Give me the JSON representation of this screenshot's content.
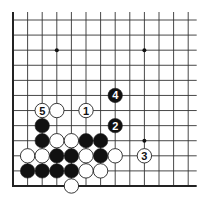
{
  "diagram": {
    "type": "go-board-diagram",
    "grid": {
      "columns": 13,
      "rows": 12,
      "origin_x": 13,
      "origin_y": 20,
      "spacing_x": 14.6,
      "spacing_y": 15.09,
      "edges": {
        "left": true,
        "bottom": true,
        "top": false,
        "right": false
      },
      "line_color": "#333333",
      "edge_color": "#222222"
    },
    "star_points": [
      {
        "col": 3,
        "row": 2
      },
      {
        "col": 9,
        "row": 2
      },
      {
        "col": 9,
        "row": 8
      }
    ],
    "stones": [
      {
        "col": 2,
        "row": 6,
        "color": "white",
        "label": "5"
      },
      {
        "col": 3,
        "row": 6,
        "color": "white",
        "label": ""
      },
      {
        "col": 5,
        "row": 6,
        "color": "white",
        "label": "1"
      },
      {
        "col": 7,
        "row": 5,
        "color": "black",
        "label": "4"
      },
      {
        "col": 2,
        "row": 7,
        "color": "black",
        "label": ""
      },
      {
        "col": 7,
        "row": 7,
        "color": "black",
        "label": "2"
      },
      {
        "col": 2,
        "row": 8,
        "color": "black",
        "label": ""
      },
      {
        "col": 3,
        "row": 8,
        "color": "white",
        "label": ""
      },
      {
        "col": 4,
        "row": 8,
        "color": "white",
        "label": ""
      },
      {
        "col": 5,
        "row": 8,
        "color": "black",
        "label": ""
      },
      {
        "col": 6,
        "row": 8,
        "color": "black",
        "label": ""
      },
      {
        "col": 1,
        "row": 9,
        "color": "white",
        "label": ""
      },
      {
        "col": 2,
        "row": 9,
        "color": "white",
        "label": ""
      },
      {
        "col": 3,
        "row": 9,
        "color": "black",
        "label": ""
      },
      {
        "col": 4,
        "row": 9,
        "color": "black",
        "label": ""
      },
      {
        "col": 5,
        "row": 9,
        "color": "white",
        "label": ""
      },
      {
        "col": 6,
        "row": 9,
        "color": "black",
        "label": ""
      },
      {
        "col": 7,
        "row": 9,
        "color": "white",
        "label": ""
      },
      {
        "col": 9,
        "row": 9,
        "color": "white",
        "label": "3"
      },
      {
        "col": 1,
        "row": 10,
        "color": "black",
        "label": ""
      },
      {
        "col": 2,
        "row": 10,
        "color": "black",
        "label": ""
      },
      {
        "col": 3,
        "row": 10,
        "color": "black",
        "label": ""
      },
      {
        "col": 4,
        "row": 10,
        "color": "black",
        "label": ""
      },
      {
        "col": 5,
        "row": 10,
        "color": "white",
        "label": ""
      },
      {
        "col": 6,
        "row": 10,
        "color": "white",
        "label": ""
      },
      {
        "col": 4,
        "row": 11,
        "color": "white",
        "label": ""
      }
    ],
    "move_sequence": [
      {
        "move": "1",
        "color": "white"
      },
      {
        "move": "2",
        "color": "black"
      },
      {
        "move": "3",
        "color": "white"
      },
      {
        "move": "4",
        "color": "black"
      },
      {
        "move": "5",
        "color": "white"
      }
    ],
    "colors": {
      "black_stone": "#111111",
      "white_stone": "#ffffff",
      "stone_outline": "#222222",
      "label_on_black": "#ffffff",
      "label_on_white": "#111111",
      "background": "#ffffff"
    }
  }
}
